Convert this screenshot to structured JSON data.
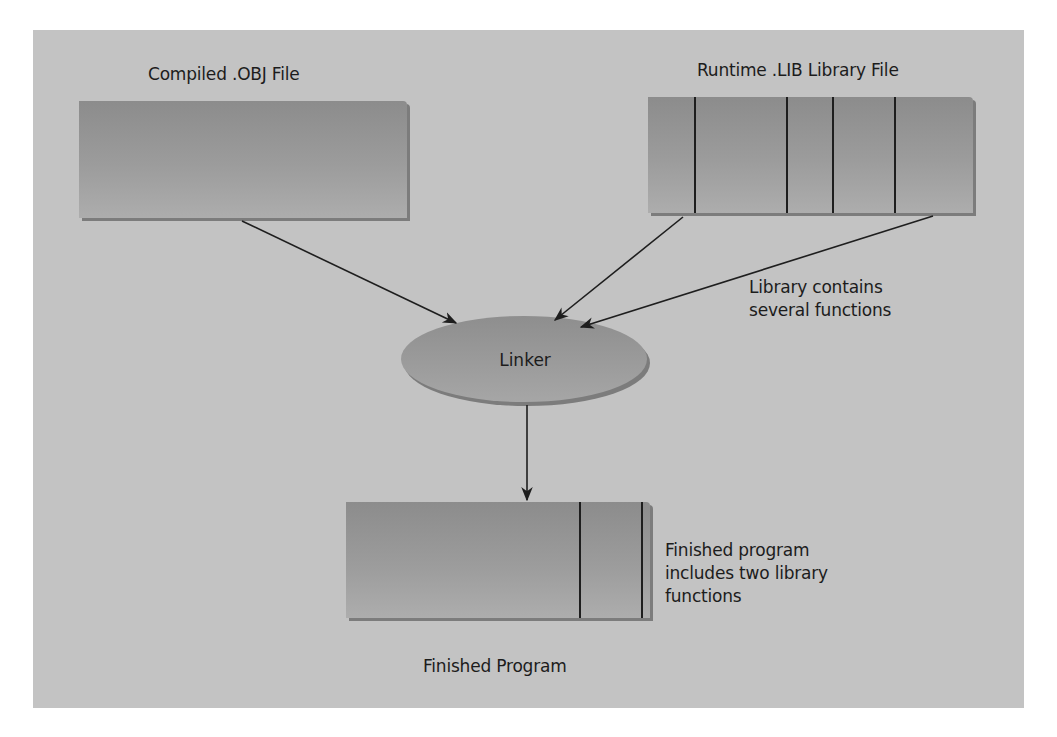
{
  "diagram": {
    "nodes": {
      "obj_file": {
        "label": "Compiled .OBJ File"
      },
      "lib_file": {
        "label": "Runtime .LIB Library File",
        "segments": 6
      },
      "linker": {
        "label": "Linker"
      },
      "finished": {
        "label": "Finished Program",
        "segments": 3
      }
    },
    "notes": {
      "library": [
        "Library contains",
        "several functions"
      ],
      "finished": [
        "Finished program",
        "includes two library",
        "functions"
      ]
    },
    "edges": [
      {
        "from": "obj_file",
        "to": "linker"
      },
      {
        "from": "lib_file",
        "to": "linker"
      },
      {
        "from": "lib_file",
        "to": "linker"
      },
      {
        "from": "linker",
        "to": "finished"
      }
    ],
    "colors": {
      "panel": "#c3c3c3",
      "box": "#9a9a9a",
      "box_shadow": "#7c7c7c",
      "line": "#1e1e1e"
    }
  }
}
